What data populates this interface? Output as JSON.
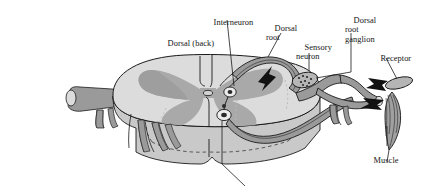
{
  "figure": {
    "width": 422,
    "height": 190,
    "background": "#ffffff"
  },
  "palette": {
    "white_matter": "#dcdcdc",
    "gray_matter": "#a9a9a9",
    "nerve": "#9a9a9a",
    "nerve_dark": "#8c8c8c",
    "cord_front": "#c9c9c9",
    "outline": "#1a1a1a",
    "arrow_black": "#111111",
    "receptor_fill": "#b5b5b5",
    "muscle_fill": "#a0a0a0",
    "text": "#141414"
  },
  "labels": [
    {
      "id": "interneuron",
      "text": "Interneuron",
      "lines": [
        "Interneuron"
      ],
      "x": 205,
      "y": 9,
      "align": "left"
    },
    {
      "id": "dorsal-back",
      "text": "Dorsal (back)",
      "lines": [
        "Dorsal (back)"
      ],
      "x": 159,
      "y": 30,
      "align": "left"
    },
    {
      "id": "dorsal-root",
      "text": "Dorsal root",
      "lines": [
        "Dorsal",
        "root"
      ],
      "x": 266,
      "y": 16,
      "align": "left"
    },
    {
      "id": "sensory-neuron",
      "text": "Sensory neuron",
      "lines": [
        "Sensory",
        "neuron"
      ],
      "x": 296,
      "y": 35,
      "align": "left"
    },
    {
      "id": "dorsal-root-ganglion",
      "text": "Dorsal root ganglion",
      "lines": [
        "Dorsal",
        "root",
        "ganglion"
      ],
      "x": 345,
      "y": 8,
      "align": "left"
    },
    {
      "id": "receptor",
      "text": "Receptor",
      "lines": [
        "Receptor"
      ],
      "x": 372,
      "y": 46,
      "align": "left"
    },
    {
      "id": "muscle",
      "text": "Muscle",
      "lines": [
        "Muscle"
      ],
      "x": 365,
      "y": 148,
      "align": "left"
    }
  ],
  "structures": [
    {
      "id": "spinal-cord",
      "name": "spinal cord cross-section"
    },
    {
      "id": "gray-matter",
      "name": "butterfly-shaped gray matter"
    },
    {
      "id": "white-matter",
      "name": "white matter"
    },
    {
      "id": "central-canal",
      "name": "central canal"
    },
    {
      "id": "dorsal-median-sulcus",
      "name": "dorsal median sulcus"
    },
    {
      "id": "ventral-median-fissure",
      "name": "ventral median fissure"
    },
    {
      "id": "interneuron-cell",
      "name": "interneuron cell body"
    },
    {
      "id": "motor-neuron-cell",
      "name": "motor neuron cell body"
    },
    {
      "id": "dorsal-root",
      "name": "dorsal root"
    },
    {
      "id": "ventral-root",
      "name": "ventral root"
    },
    {
      "id": "dorsal-root-ganglion",
      "name": "dorsal root ganglion"
    },
    {
      "id": "spinal-nerve",
      "name": "spinal nerve trunk"
    },
    {
      "id": "receptor",
      "name": "sensory receptor"
    },
    {
      "id": "muscle",
      "name": "skeletal muscle effector"
    },
    {
      "id": "signal-arrows",
      "name": "impulse direction arrowheads"
    }
  ],
  "leader_lines": [
    {
      "from": "interneuron",
      "note": "down-left to interneuron cell body"
    },
    {
      "from": "dorsal-root",
      "note": "down-left to dorsal root curve"
    },
    {
      "from": "sensory-neuron",
      "note": "down to sensory axon"
    },
    {
      "from": "dorsal-root-ganglion",
      "note": "down-left to ganglion"
    },
    {
      "from": "receptor",
      "note": "down-left to receptor ellipse"
    },
    {
      "from": "muscle",
      "note": "up to muscle belly"
    },
    {
      "from": "unlabeled-ventral",
      "note": "from motor neuron down-right off bottom edge"
    }
  ]
}
